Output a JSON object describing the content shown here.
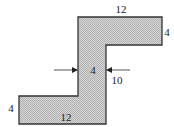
{
  "diagram": {
    "type": "z-shaped cross-section",
    "colors": {
      "fill": "#c8c8c8",
      "stroke": "#333333",
      "text": "#222222",
      "background": "#ffffff"
    },
    "shape_vertices": [
      [
        78,
        17
      ],
      [
        162,
        17
      ],
      [
        162,
        45
      ],
      [
        106,
        45
      ],
      [
        106,
        124
      ],
      [
        19,
        124
      ],
      [
        19,
        96
      ],
      [
        78,
        96
      ]
    ],
    "labels": {
      "top_width": "12",
      "top_height": "4",
      "stem_thickness": "4",
      "stem_height": "10",
      "bottom_height": "4",
      "bottom_width": "12"
    },
    "label_positions": {
      "top_width": [
        121,
        13
      ],
      "top_height": [
        167,
        36
      ],
      "stem_thickness": [
        93,
        74
      ],
      "stem_height": [
        117,
        84
      ],
      "bottom_height": [
        11,
        112
      ],
      "bottom_width": [
        66,
        121
      ]
    },
    "arrows": [
      {
        "name": "left-arrow",
        "from": [
          54,
          70
        ],
        "to": [
          77,
          70
        ]
      },
      {
        "name": "right-arrow",
        "from": [
          130,
          70
        ],
        "to": [
          107,
          70
        ]
      }
    ]
  }
}
